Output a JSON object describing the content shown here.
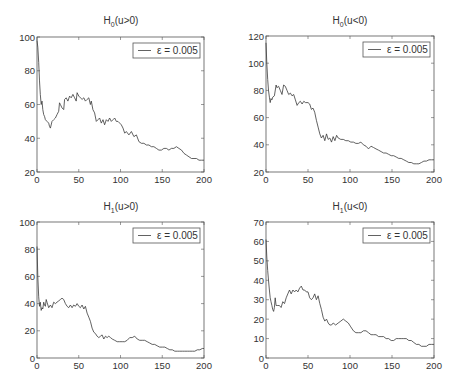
{
  "chart_data": [
    {
      "type": "line",
      "title": "H0(u>0)",
      "title_main": "H",
      "title_sub": "0",
      "title_rest": "(u>0)",
      "xlabel": "",
      "ylabel": "",
      "xlim": [
        0,
        200
      ],
      "ylim": [
        20,
        100
      ],
      "xticks": [
        0,
        50,
        100,
        150,
        200
      ],
      "yticks": [
        20,
        40,
        60,
        80,
        100
      ],
      "grid": false,
      "legend_position": "upper right",
      "series": [
        {
          "name": "ε = 0.005",
          "x": [
            0,
            1,
            2,
            3,
            4,
            5,
            6,
            7,
            8,
            9,
            10,
            12,
            14,
            15,
            16,
            18,
            20,
            22,
            24,
            26,
            27,
            28,
            30,
            32,
            33,
            35,
            37,
            39,
            41,
            43,
            45,
            47,
            48,
            50,
            52,
            54,
            56,
            58,
            60,
            62,
            64,
            65,
            67,
            69,
            71,
            73,
            75,
            77,
            79,
            81,
            83,
            85,
            87,
            89,
            91,
            93,
            95,
            97,
            99,
            101,
            103,
            105,
            107,
            110,
            113,
            116,
            119,
            122,
            125,
            128,
            131,
            134,
            137,
            140,
            143,
            146,
            149,
            152,
            155,
            158,
            161,
            164,
            167,
            170,
            173,
            176,
            179,
            182,
            185,
            188,
            191,
            194,
            197,
            200
          ],
          "y": [
            98,
            94,
            85,
            74,
            66,
            60,
            62,
            57,
            54,
            53,
            51,
            50,
            49,
            47,
            46,
            50,
            51,
            52,
            54,
            56,
            61,
            60,
            58,
            57,
            63,
            64,
            62,
            65,
            64,
            66,
            64,
            62,
            67,
            65,
            64,
            63,
            64,
            62,
            63,
            64,
            60,
            62,
            57,
            55,
            50,
            51,
            52,
            49,
            51,
            48,
            51,
            50,
            52,
            50,
            51,
            52,
            50,
            50,
            49,
            48,
            46,
            43,
            44,
            42,
            44,
            41,
            42,
            38,
            37,
            37,
            36,
            36,
            35,
            35,
            34,
            33,
            33,
            34,
            34,
            33,
            34,
            34,
            35,
            34,
            33,
            31,
            30,
            29,
            28,
            28,
            28,
            27,
            27,
            27
          ]
        }
      ]
    },
    {
      "type": "line",
      "title": "H0(u<0)",
      "title_main": "H",
      "title_sub": "0",
      "title_rest": "(u<0)",
      "xlabel": "",
      "ylabel": "",
      "xlim": [
        0,
        200
      ],
      "ylim": [
        20,
        120
      ],
      "xticks": [
        0,
        50,
        100,
        150,
        200
      ],
      "yticks": [
        20,
        40,
        60,
        80,
        100,
        120
      ],
      "grid": false,
      "legend_position": "upper right",
      "series": [
        {
          "name": "ε = 0.005",
          "x": [
            0,
            1,
            2,
            3,
            4,
            5,
            6,
            7,
            8,
            10,
            12,
            13,
            15,
            17,
            19,
            21,
            23,
            25,
            27,
            29,
            31,
            33,
            35,
            37,
            39,
            41,
            43,
            45,
            47,
            50,
            52,
            54,
            56,
            58,
            60,
            62,
            64,
            66,
            68,
            70,
            72,
            74,
            76,
            78,
            80,
            82,
            84,
            86,
            89,
            92,
            95,
            98,
            101,
            104,
            107,
            110,
            113,
            116,
            119,
            122,
            125,
            128,
            131,
            134,
            137,
            140,
            143,
            146,
            149,
            152,
            155,
            158,
            161,
            164,
            167,
            170,
            173,
            176,
            179,
            182,
            185,
            188,
            191,
            194,
            197,
            200
          ],
          "y": [
            115,
            100,
            88,
            80,
            75,
            71,
            74,
            73,
            75,
            76,
            84,
            82,
            83,
            80,
            77,
            84,
            83,
            80,
            77,
            78,
            76,
            77,
            73,
            69,
            71,
            72,
            70,
            72,
            71,
            71,
            70,
            66,
            67,
            64,
            58,
            53,
            48,
            45,
            47,
            43,
            48,
            44,
            45,
            42,
            46,
            43,
            47,
            45,
            44,
            44,
            43,
            43,
            42,
            42,
            41,
            41,
            42,
            40,
            39,
            37,
            39,
            38,
            37,
            36,
            35,
            34,
            34,
            33,
            32,
            32,
            31,
            30,
            30,
            29,
            28,
            27,
            27,
            26,
            26,
            26,
            27,
            28,
            28,
            29,
            29,
            29
          ]
        }
      ]
    },
    {
      "type": "line",
      "title": "H1(u>0)",
      "title_main": "H",
      "title_sub": "1",
      "title_rest": "(u>0)",
      "xlabel": "",
      "ylabel": "",
      "xlim": [
        0,
        200
      ],
      "ylim": [
        0,
        100
      ],
      "xticks": [
        0,
        50,
        100,
        150,
        200
      ],
      "yticks": [
        0,
        20,
        40,
        60,
        80,
        100
      ],
      "grid": false,
      "legend_position": "upper right",
      "series": [
        {
          "name": "ε = 0.005",
          "x": [
            0,
            1,
            2,
            3,
            4,
            5,
            6,
            7,
            8,
            9,
            10,
            11,
            12,
            14,
            16,
            18,
            20,
            22,
            24,
            26,
            28,
            30,
            32,
            34,
            36,
            38,
            40,
            42,
            44,
            46,
            48,
            50,
            52,
            54,
            56,
            58,
            60,
            62,
            64,
            66,
            68,
            70,
            72,
            74,
            76,
            78,
            80,
            82,
            84,
            86,
            88,
            90,
            93,
            96,
            99,
            102,
            105,
            108,
            111,
            114,
            117,
            120,
            123,
            126,
            129,
            132,
            135,
            138,
            141,
            144,
            147,
            150,
            153,
            156,
            159,
            162,
            165,
            168,
            171,
            174,
            177,
            180,
            183,
            186,
            189,
            192,
            195,
            198,
            200
          ],
          "y": [
            82,
            60,
            45,
            38,
            41,
            35,
            37,
            36,
            41,
            39,
            38,
            43,
            41,
            37,
            39,
            37,
            41,
            40,
            41,
            42,
            43,
            44,
            43,
            40,
            38,
            37,
            39,
            37,
            39,
            38,
            40,
            38,
            37,
            39,
            36,
            38,
            33,
            30,
            27,
            22,
            19,
            18,
            16,
            15,
            16,
            17,
            14,
            16,
            15,
            16,
            15,
            14,
            13,
            12,
            12,
            12,
            12,
            13,
            15,
            15,
            16,
            14,
            13,
            13,
            13,
            12,
            11,
            10,
            10,
            9,
            8,
            8,
            8,
            7,
            6,
            6,
            5,
            5,
            5,
            5,
            5,
            5,
            5,
            5,
            5,
            6,
            6,
            7,
            7
          ]
        }
      ]
    },
    {
      "type": "line",
      "title": "H1(u<0)",
      "title_main": "H",
      "title_sub": "1",
      "title_rest": "(u<0)",
      "xlabel": "",
      "ylabel": "",
      "xlim": [
        0,
        200
      ],
      "ylim": [
        0,
        70
      ],
      "xticks": [
        0,
        50,
        100,
        150,
        200
      ],
      "yticks": [
        0,
        10,
        20,
        30,
        40,
        50,
        60,
        70
      ],
      "grid": false,
      "legend_position": "upper right",
      "series": [
        {
          "name": "ε = 0.005",
          "x": [
            0,
            1,
            2,
            3,
            4,
            5,
            6,
            7,
            8,
            9,
            10,
            11,
            12,
            14,
            16,
            18,
            20,
            22,
            24,
            26,
            28,
            30,
            32,
            34,
            36,
            38,
            40,
            42,
            44,
            46,
            48,
            50,
            52,
            54,
            56,
            58,
            60,
            62,
            64,
            66,
            68,
            70,
            72,
            74,
            76,
            78,
            80,
            83,
            86,
            89,
            92,
            95,
            98,
            101,
            104,
            107,
            110,
            113,
            116,
            119,
            122,
            125,
            128,
            131,
            134,
            137,
            140,
            143,
            146,
            149,
            152,
            155,
            158,
            161,
            164,
            167,
            170,
            173,
            176,
            179,
            182,
            185,
            188,
            191,
            194,
            197,
            200
          ],
          "y": [
            61,
            52,
            45,
            40,
            35,
            31,
            29,
            27,
            25,
            24,
            26,
            31,
            27,
            27,
            27,
            26,
            29,
            28,
            31,
            33,
            35,
            33,
            35,
            34,
            35,
            34,
            36,
            37,
            35,
            35,
            34,
            34,
            31,
            30,
            31,
            33,
            30,
            32,
            28,
            25,
            21,
            19,
            20,
            18,
            17,
            17,
            18,
            17,
            18,
            19,
            20,
            19,
            18,
            16,
            14,
            13,
            13,
            13,
            14,
            14,
            13,
            12,
            12,
            12,
            11,
            11,
            11,
            10,
            10,
            9,
            9,
            10,
            10,
            10,
            10,
            10,
            9,
            9,
            8,
            7,
            7,
            6,
            6,
            6,
            7,
            7,
            7
          ]
        }
      ]
    }
  ],
  "panels": [
    {
      "legend_label": "ε = 0.005",
      "line_color": "#3a3a3a",
      "axis_color": "#555555"
    },
    {
      "legend_label": "ε = 0.005",
      "line_color": "#3a3a3a",
      "axis_color": "#555555"
    },
    {
      "legend_label": "ε = 0.005",
      "line_color": "#3a3a3a",
      "axis_color": "#555555"
    },
    {
      "legend_label": "ε = 0.005",
      "line_color": "#3a3a3a",
      "axis_color": "#555555"
    }
  ]
}
